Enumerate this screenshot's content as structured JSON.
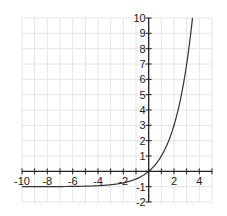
{
  "chart_data": {
    "type": "line",
    "title": "",
    "xlabel": "",
    "ylabel": "",
    "xlim": [
      -10,
      5
    ],
    "ylim": [
      -2,
      10
    ],
    "grid": true,
    "legend": null,
    "x_ticks": [
      -10,
      -8,
      -6,
      -4,
      -2,
      2,
      4
    ],
    "y_ticks": [
      -2,
      -1,
      1,
      2,
      3,
      4,
      5,
      6,
      7,
      8,
      9,
      10
    ],
    "series": [
      {
        "name": "y = 2^x - 1",
        "x": [
          -10,
          -8,
          -6,
          -5,
          -4,
          -3,
          -2,
          -1,
          0,
          0.5,
          1,
          1.5,
          2,
          2.5,
          3,
          3.46
        ],
        "values": [
          -0.999,
          -0.996,
          -0.984,
          -0.969,
          -0.938,
          -0.875,
          -0.75,
          -0.5,
          0,
          0.414,
          1,
          1.828,
          3,
          4.657,
          7,
          10
        ]
      }
    ],
    "asymptote": -1
  },
  "colors": {
    "grid": "#e4e4e4",
    "axis": "#222222",
    "curve": "#333333"
  }
}
